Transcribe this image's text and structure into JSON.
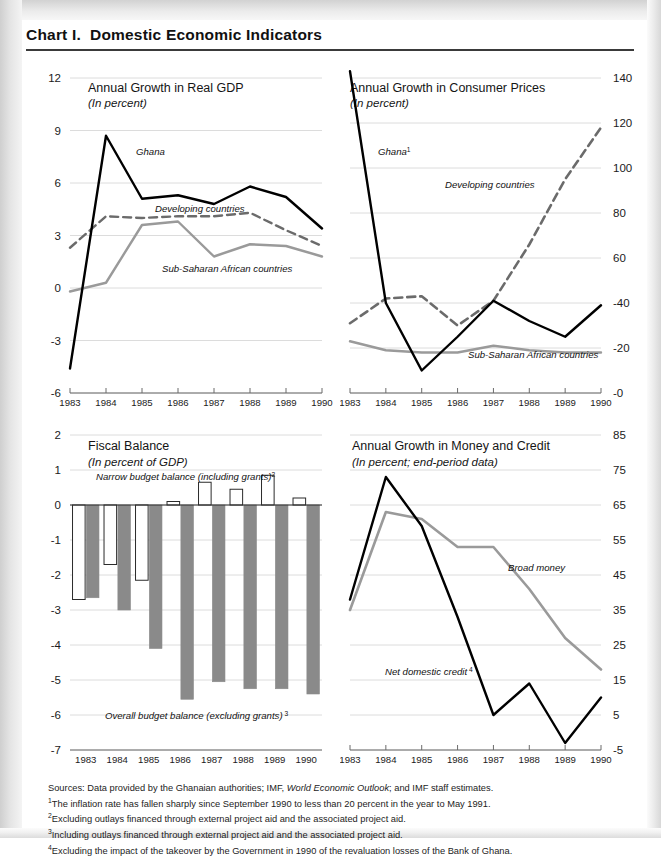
{
  "header": {
    "title": "Chart I.  Domestic Economic Indicators"
  },
  "footnotes": {
    "sources_prefix": "Sources: Data provided by the Ghanaian authorities; IMF, ",
    "sources_italic": "World Economic Outlook",
    "sources_suffix": "; and IMF staff estimates.",
    "note1_marker": "1",
    "note1": "The inflation rate has fallen sharply since September 1990 to less than 20 percent in the year to May 1991.",
    "note2_marker": "2",
    "note2": "Excluding outlays financed through external project aid and the associated project aid.",
    "note3_marker": "3",
    "note3": "Including outlays financed through external project aid and the associated project aid.",
    "note4_marker": "4",
    "note4": "Excluding the impact of the takeover by the Government in 1990 of the revaluation losses of the Bank of Ghana."
  },
  "colors": {
    "ghana_line": "#000000",
    "developing_line": "#6b6b6b",
    "subsaharan_line": "#9a9a9a",
    "grid": "#dcdcdc",
    "axis": "#5a5a5a",
    "bar_filled": "#8a8a8a",
    "bar_hollow": "#ffffff",
    "rule": "#3a3a3a"
  },
  "chart_data": [
    {
      "id": "real-gdp",
      "type": "line",
      "title": "Annual Growth in Real GDP",
      "subtitle": "(In percent)",
      "xlabel": "",
      "ylabel": "",
      "x": [
        "1983",
        "1984",
        "1985",
        "1986",
        "1987",
        "1988",
        "1989",
        "1990"
      ],
      "yticks": [
        12,
        9,
        6,
        3,
        0,
        -3,
        -6
      ],
      "ylim": [
        -6,
        12
      ],
      "axis_side": "left",
      "grid": true,
      "legend_position": "inline-annotations",
      "series": [
        {
          "name": "Ghana",
          "style": "solid-black",
          "values": [
            -4.6,
            8.7,
            5.1,
            5.3,
            4.8,
            5.8,
            5.2,
            3.4
          ]
        },
        {
          "name": "Developing countries",
          "style": "dashed-gray",
          "values": [
            2.3,
            4.1,
            4.0,
            4.1,
            4.1,
            4.3,
            3.3,
            2.4
          ]
        },
        {
          "name": "Sub-Saharan African countries",
          "style": "solid-gray",
          "values": [
            -0.2,
            0.3,
            3.6,
            3.8,
            1.8,
            2.5,
            2.4,
            1.8
          ]
        }
      ]
    },
    {
      "id": "consumer-prices",
      "type": "line",
      "title": "Annual Growth in Consumer Prices",
      "subtitle": "(In percent)",
      "xlabel": "",
      "ylabel": "",
      "x": [
        "1983",
        "1984",
        "1985",
        "1986",
        "1987",
        "1988",
        "1989",
        "1990"
      ],
      "yticks": [
        140,
        120,
        100,
        80,
        60,
        40,
        20,
        0
      ],
      "ytick_labels": [
        "140",
        "120",
        "100",
        "80",
        "60",
        "-40",
        "-20",
        "-0"
      ],
      "ylim": [
        0,
        140
      ],
      "axis_side": "right",
      "grid": true,
      "legend_position": "inline-annotations",
      "series": [
        {
          "name": "Ghana",
          "marker": "1",
          "style": "solid-black",
          "values": [
            143,
            40,
            10,
            25,
            41,
            32,
            25,
            39
          ]
        },
        {
          "name": "Developing countries",
          "style": "dashed-gray",
          "values": [
            31,
            42,
            43,
            36,
            30,
            41,
            66,
            95,
            118
          ]
        },
        {
          "name": "Sub-Saharan African countries",
          "style": "solid-gray",
          "values": [
            23,
            19,
            18,
            18,
            21,
            19,
            18,
            18
          ]
        }
      ],
      "series_notes": "Developing countries series has 8 plotted points across 1983-1990: 31, 42, 43, 30, 41, 66, 95, 118"
    },
    {
      "id": "fiscal-balance",
      "type": "bar",
      "title": "Fiscal Balance",
      "subtitle": "(In percent of GDP)",
      "xlabel": "",
      "ylabel": "",
      "categories": [
        "1983",
        "1984",
        "1985",
        "1986",
        "1987",
        "1988",
        "1989",
        "1990"
      ],
      "yticks": [
        2,
        1,
        0,
        -1,
        -2,
        -3,
        -4,
        -5,
        -6,
        -7
      ],
      "ylim": [
        -7,
        2
      ],
      "axis_side": "left",
      "grid": true,
      "series": [
        {
          "name": "Narrow budget balance (including grants)",
          "marker": "2",
          "style": "hollow",
          "values": [
            -2.7,
            -1.7,
            -2.15,
            0.1,
            0.65,
            0.45,
            0.85,
            0.2
          ]
        },
        {
          "name": "Overall budget balance (excluding grants)",
          "marker": "3",
          "style": "filled",
          "values": [
            -2.65,
            -3.0,
            -4.1,
            -5.55,
            -5.05,
            -5.25,
            -5.25,
            -5.4
          ]
        }
      ]
    },
    {
      "id": "money-and-credit",
      "type": "line",
      "title": "Annual Growth in Money and Credit",
      "subtitle": "(In percent; end-period data)",
      "xlabel": "",
      "ylabel": "",
      "x": [
        "1983",
        "1984",
        "1985",
        "1986",
        "1987",
        "1988",
        "1989",
        "1990"
      ],
      "yticks": [
        85,
        75,
        65,
        55,
        45,
        35,
        25,
        15,
        5,
        -5
      ],
      "ylim": [
        -5,
        85
      ],
      "axis_side": "right",
      "grid": true,
      "legend_position": "inline-annotations",
      "series": [
        {
          "name": "Net domestic credit",
          "marker": "4",
          "style": "solid-black",
          "values": [
            38,
            73,
            59,
            33,
            5,
            14,
            -3,
            10
          ]
        },
        {
          "name": "Broad money",
          "style": "solid-gray",
          "values": [
            35,
            63,
            61,
            53,
            53,
            41,
            27,
            18
          ]
        }
      ]
    }
  ]
}
